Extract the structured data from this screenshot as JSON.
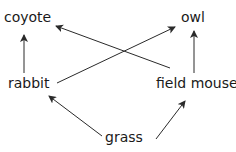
{
  "diagram": {
    "nodes": {
      "coyote": {
        "label": "coyote"
      },
      "owl": {
        "label": "owl"
      },
      "rabbit": {
        "label": "rabbit"
      },
      "field_mouse": {
        "label": "field mouse"
      },
      "grass": {
        "label": "grass"
      }
    },
    "edges": [
      {
        "from": "grass",
        "to": "rabbit"
      },
      {
        "from": "grass",
        "to": "field mouse"
      },
      {
        "from": "rabbit",
        "to": "coyote"
      },
      {
        "from": "rabbit",
        "to": "owl"
      },
      {
        "from": "field mouse",
        "to": "coyote"
      },
      {
        "from": "field mouse",
        "to": "owl"
      }
    ],
    "colors": {
      "text": "#1a1a1a",
      "arrow": "#2a2a2a",
      "background": "#ffffff"
    }
  }
}
